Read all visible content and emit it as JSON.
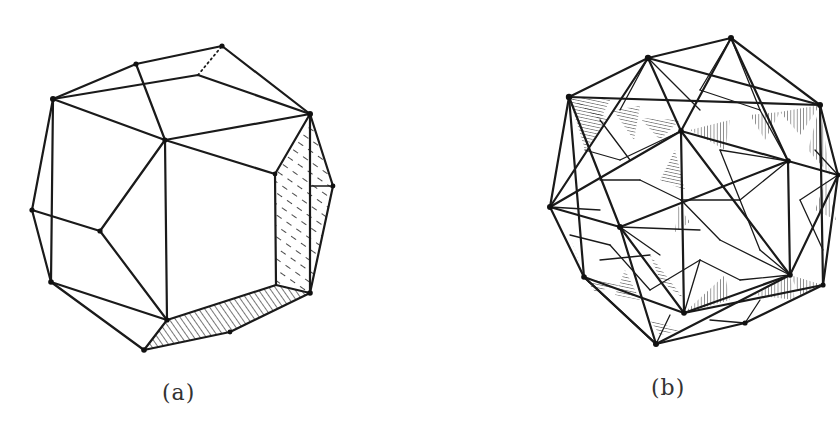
{
  "figure": {
    "panels": [
      {
        "id": "a",
        "label": "(a)",
        "description": "Polyhedron drawing with hatched faces (chamfered cube view)"
      },
      {
        "id": "b",
        "label": "(b)",
        "description": "Stellated polyhedron compound with hatched triangular faces"
      }
    ]
  },
  "colors": {
    "ink": "#1a1a1a",
    "background": "#ffffff",
    "label": "#333333"
  }
}
